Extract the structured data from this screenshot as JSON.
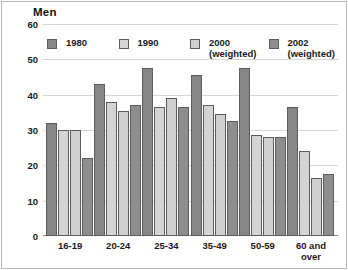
{
  "chart_data": {
    "type": "bar",
    "title": "Men",
    "xlabel": "",
    "ylabel": "",
    "ylim": [
      0,
      60
    ],
    "yticks": [
      0,
      10,
      20,
      30,
      40,
      50,
      60
    ],
    "grid": true,
    "legend_position": "top-inside",
    "categories": [
      "16-19",
      "20-24",
      "25-34",
      "35-49",
      "50-59",
      "60 and\nover"
    ],
    "series": [
      {
        "name": "1980",
        "color": "#868686",
        "values": [
          32,
          43,
          47.5,
          45.5,
          47.5,
          36.5
        ]
      },
      {
        "name": "1990",
        "color": "#d4d4d4",
        "values": [
          30,
          38,
          36.5,
          37,
          28.5,
          24
        ]
      },
      {
        "name": "2000\n(weighted)",
        "color": "#cfcfcf",
        "values": [
          30,
          35.5,
          39,
          34.5,
          28,
          16.5
        ]
      },
      {
        "name": "2002\n(weighted)",
        "color": "#8e8e8e",
        "values": [
          22,
          37,
          36.5,
          32.5,
          28,
          17.5
        ]
      }
    ]
  },
  "colors": {
    "background": "#ffffff",
    "gridline": "#d6d6d6",
    "axis": "#8a8a8a",
    "bar_outline": "#5d5d5d",
    "text": "#1a1a1a",
    "frame": "#b9b9b9"
  }
}
